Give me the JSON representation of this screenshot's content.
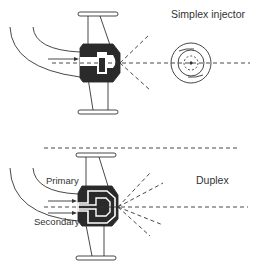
{
  "diagram": {
    "simplex": {
      "title": "Simplex injector"
    },
    "duplex": {
      "title": "Duplex",
      "labels": {
        "primary": "Primary",
        "secondary": "Secondary"
      }
    },
    "colors": {
      "line": "#333333",
      "body_fill": "#2a2a2a",
      "background": "#ffffff"
    }
  }
}
